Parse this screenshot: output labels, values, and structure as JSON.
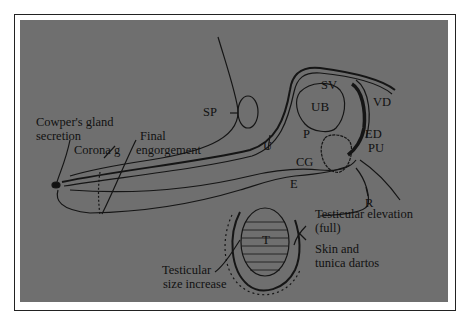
{
  "figure": {
    "colors": {
      "background": "#6f6f6f",
      "ink": "#111111",
      "frame": "#222222",
      "page": "#ffffff"
    },
    "labels": {
      "cowpers_gland": "Cowper's gland",
      "secretion": "secretion",
      "corona_g": "Corona g",
      "final": "Final",
      "engorgement": "engorgement",
      "sp": "SP",
      "u": "U",
      "sv": "SV",
      "ub": "UB",
      "vd": "VD",
      "p": "P",
      "ed": "ED",
      "pu": "PU",
      "cg": "CG",
      "e": "E",
      "r": "R",
      "t": "T",
      "testicular_elevation": "Testicular elevation",
      "full": "(full)",
      "skin_and": "Skin and",
      "tunica_dartos": "tunica dartos",
      "testicular": "Testicular",
      "size_increase": "size increase"
    }
  }
}
